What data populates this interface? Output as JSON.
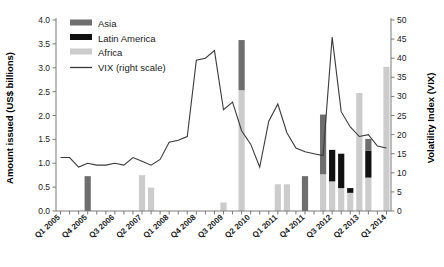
{
  "chart_data": {
    "type": "bar",
    "title": "",
    "subtitle": "",
    "ylabel": "Amount issued (US$ billions)",
    "ylabel_right": "Volatility Index (VIX)",
    "xlabel": "",
    "ylim": [
      0,
      4.0
    ],
    "ylim_right": [
      0,
      50
    ],
    "yticks": [
      "0.0",
      "0.5",
      "1.0",
      "1.5",
      "2.0",
      "2.5",
      "3.0",
      "3.5",
      "4.0"
    ],
    "ytick_values": [
      0,
      0.5,
      1.0,
      1.5,
      2.0,
      2.5,
      3.0,
      3.5,
      4.0
    ],
    "yticks_right": [
      "0",
      "5",
      "10",
      "15",
      "20",
      "25",
      "30",
      "35",
      "40",
      "45",
      "50"
    ],
    "ytick_values_right": [
      0,
      5,
      10,
      15,
      20,
      25,
      30,
      35,
      40,
      45,
      50
    ],
    "grid": false,
    "legend_position": "top-left",
    "stacked": true,
    "categories": [
      "Q1 2005",
      "Q2 2005",
      "Q3 2005",
      "Q4 2005",
      "Q1 2006",
      "Q2 2006",
      "Q3 2006",
      "Q4 2006",
      "Q1 2007",
      "Q2 2007",
      "Q3 2007",
      "Q4 2007",
      "Q1 2008",
      "Q2 2008",
      "Q3 2008",
      "Q4 2008",
      "Q1 2009",
      "Q2 2009",
      "Q3 2009",
      "Q4 2009",
      "Q1 2010",
      "Q2 2010",
      "Q3 2010",
      "Q4 2010",
      "Q1 2011",
      "Q2 2011",
      "Q3 2011",
      "Q4 2011",
      "Q1 2012",
      "Q2 2012",
      "Q3 2012",
      "Q4 2012",
      "Q1 2013",
      "Q2 2013",
      "Q3 2013",
      "Q4 2013",
      "Q1 2014"
    ],
    "xtick_labels": [
      "Q1 2005",
      "Q4 2005",
      "Q3 2006",
      "Q2 2007",
      "Q1 2008",
      "Q4 2008",
      "Q3 2009",
      "Q2 2010",
      "Q1 2011",
      "Q4 2011",
      "Q3 2012",
      "Q2 2013",
      "Q1 2014"
    ],
    "xtick_indices": [
      0,
      3,
      6,
      9,
      12,
      15,
      18,
      21,
      24,
      27,
      30,
      33,
      36
    ],
    "series": [
      {
        "name": "Africa",
        "color": "#cccccc",
        "values": [
          0,
          0,
          0,
          0,
          0,
          0,
          0,
          0,
          0,
          0.75,
          0.49,
          0,
          0,
          0,
          0,
          0,
          0,
          0,
          0.18,
          0,
          2.53,
          0,
          0,
          0,
          0.56,
          0.56,
          0,
          0,
          0,
          0.77,
          0.62,
          0.48,
          0.38,
          2.47,
          0.7,
          0,
          3.02
        ]
      },
      {
        "name": "Latin America",
        "color": "#111111",
        "values": [
          0,
          0,
          0,
          0,
          0,
          0,
          0,
          0,
          0,
          0,
          0,
          0,
          0,
          0,
          0,
          0,
          0,
          0,
          0,
          0,
          0,
          0,
          0,
          0,
          0,
          0,
          0,
          0,
          0,
          0,
          0.66,
          0.72,
          0.1,
          0,
          0.56,
          0,
          0
        ]
      },
      {
        "name": "Asia",
        "color": "#6e6e6e",
        "values": [
          0,
          0,
          0,
          0.73,
          0,
          0,
          0,
          0,
          0,
          0,
          0,
          0,
          0,
          0,
          0,
          0,
          0,
          0,
          0,
          0,
          1.05,
          0,
          0,
          0,
          0,
          0,
          0,
          0.73,
          0,
          1.25,
          0,
          0,
          0,
          0,
          0.25,
          0,
          0
        ]
      }
    ],
    "line_series": {
      "name": "VIX (right scale)",
      "color": "#3a3a3a",
      "axis": "right",
      "values": [
        14.0,
        14.0,
        11.5,
        12.5,
        12.0,
        12.0,
        12.5,
        12.0,
        14.0,
        13.0,
        12.0,
        13.5,
        18.0,
        18.5,
        19.5,
        39.5,
        40.0,
        42.0,
        26.5,
        28.5,
        21.0,
        17.5,
        11.5,
        23.5,
        28.0,
        20.5,
        16.5,
        15.5,
        15.0,
        14.5,
        45.5,
        26.0,
        22.0,
        19.5,
        20.0,
        17.0,
        16.5
      ]
    },
    "legend": [
      {
        "label": "Asia",
        "color": "#6e6e6e",
        "marker": "swatch"
      },
      {
        "label": "Latin America",
        "color": "#111111",
        "marker": "swatch"
      },
      {
        "label": "Africa",
        "color": "#cccccc",
        "marker": "swatch"
      },
      {
        "label": "VIX (right scale)",
        "color": "#3a3a3a",
        "marker": "line"
      }
    ]
  }
}
